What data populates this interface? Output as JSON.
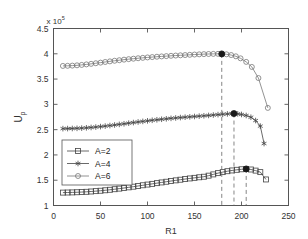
{
  "figure": {
    "background": "#ffffff",
    "axes_color": "#555555"
  },
  "chart_data": {
    "type": "line",
    "title": "",
    "xlabel": "R1",
    "ylabel": "U_p",
    "y_exponent_label": "x 10",
    "y_exponent_power": "5",
    "xlim": [
      0,
      250
    ],
    "ylim": [
      1,
      4.5
    ],
    "xticks": [
      0,
      50,
      100,
      150,
      200,
      250
    ],
    "xticklabels": [
      "0",
      "50",
      "100",
      "150",
      "200",
      "250"
    ],
    "yticks": [
      1,
      1.5,
      2,
      2.5,
      3,
      3.5,
      4,
      4.5
    ],
    "yticklabels": [
      "1",
      "1.5",
      "2",
      "2.5",
      "3",
      "3.5",
      "4",
      "4.5"
    ],
    "grid": false,
    "legend_position": "center-left",
    "legend_entries": [
      "A=2",
      "A=4",
      "A=6"
    ],
    "series": [
      {
        "name": "A=2",
        "marker": "square",
        "color": "#444444",
        "x": [
          10,
          15,
          20,
          25,
          30,
          35,
          40,
          45,
          50,
          55,
          60,
          65,
          70,
          75,
          80,
          85,
          90,
          95,
          100,
          105,
          110,
          115,
          120,
          125,
          130,
          135,
          140,
          145,
          150,
          155,
          160,
          165,
          170,
          175,
          180,
          185,
          190,
          195,
          200,
          205,
          210,
          215,
          220,
          226
        ],
        "y": [
          1.255,
          1.257,
          1.259,
          1.262,
          1.266,
          1.271,
          1.277,
          1.284,
          1.292,
          1.301,
          1.311,
          1.322,
          1.334,
          1.346,
          1.359,
          1.372,
          1.386,
          1.4,
          1.414,
          1.428,
          1.442,
          1.456,
          1.47,
          1.484,
          1.497,
          1.51,
          1.523,
          1.535,
          1.547,
          1.558,
          1.569,
          1.59,
          1.615,
          1.64,
          1.66,
          1.678,
          1.693,
          1.706,
          1.716,
          1.723,
          1.712,
          1.69,
          1.66,
          1.515
        ]
      },
      {
        "name": "A=4",
        "marker": "star",
        "color": "#444444",
        "x": [
          10,
          15,
          20,
          25,
          30,
          35,
          40,
          45,
          50,
          55,
          60,
          65,
          70,
          75,
          80,
          85,
          90,
          95,
          100,
          105,
          110,
          115,
          120,
          125,
          130,
          135,
          140,
          145,
          150,
          155,
          160,
          165,
          170,
          175,
          180,
          185,
          190,
          192,
          196,
          200,
          205,
          210,
          215,
          220,
          224
        ],
        "y": [
          2.52,
          2.521,
          2.523,
          2.526,
          2.53,
          2.536,
          2.543,
          2.551,
          2.56,
          2.57,
          2.581,
          2.592,
          2.604,
          2.616,
          2.628,
          2.64,
          2.652,
          2.663,
          2.674,
          2.685,
          2.695,
          2.705,
          2.714,
          2.723,
          2.731,
          2.739,
          2.746,
          2.753,
          2.76,
          2.767,
          2.774,
          2.781,
          2.789,
          2.797,
          2.804,
          2.811,
          2.817,
          2.818,
          2.812,
          2.8,
          2.78,
          2.745,
          2.68,
          2.57,
          2.225
        ]
      },
      {
        "name": "A=6",
        "marker": "circle",
        "color": "#777777",
        "x": [
          10,
          15,
          20,
          25,
          30,
          35,
          40,
          45,
          50,
          55,
          60,
          65,
          70,
          75,
          80,
          85,
          90,
          95,
          100,
          105,
          110,
          115,
          120,
          125,
          130,
          135,
          140,
          145,
          150,
          155,
          160,
          165,
          170,
          175,
          179,
          184,
          189,
          194,
          199,
          205,
          211,
          218,
          228
        ],
        "y": [
          3.76,
          3.762,
          3.766,
          3.772,
          3.78,
          3.79,
          3.801,
          3.813,
          3.825,
          3.838,
          3.85,
          3.862,
          3.873,
          3.884,
          3.894,
          3.903,
          3.912,
          3.92,
          3.928,
          3.935,
          3.942,
          3.948,
          3.954,
          3.96,
          3.965,
          3.97,
          3.975,
          3.98,
          3.985,
          3.989,
          3.993,
          3.996,
          3.998,
          3.999,
          3.998,
          3.99,
          3.975,
          3.95,
          3.91,
          3.84,
          3.74,
          3.52,
          2.93
        ]
      }
    ],
    "peak_markers": [
      {
        "series": "A=6",
        "x": 179,
        "y": 3.998,
        "style": "filled-circle",
        "dashed_vline": true
      },
      {
        "series": "A=4",
        "x": 192,
        "y": 2.818,
        "style": "filled-circle",
        "dashed_vline": true
      },
      {
        "series": "A=2",
        "x": 205,
        "y": 1.723,
        "style": "filled-circle",
        "dashed_vline": true
      }
    ]
  }
}
